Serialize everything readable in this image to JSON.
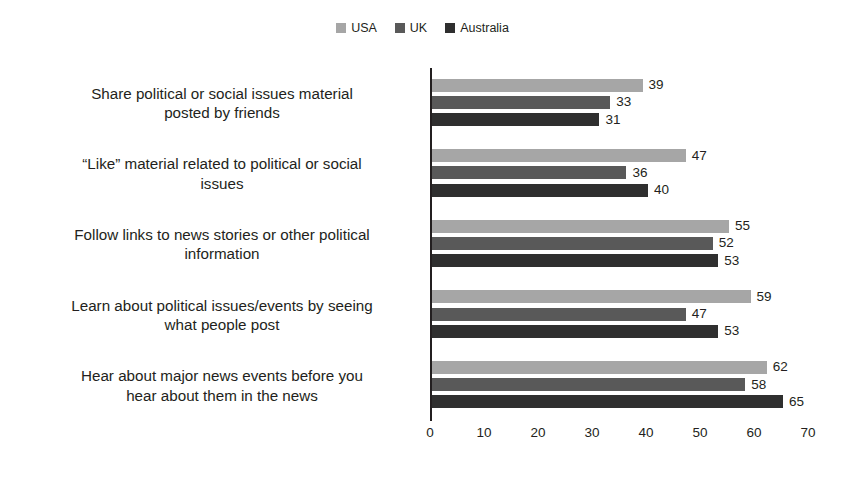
{
  "chart_data": {
    "type": "bar",
    "orientation": "horizontal",
    "title": "",
    "subtitle": "",
    "xlabel": "",
    "ylabel": "",
    "xlim": [
      0,
      70
    ],
    "xticks": [
      0,
      10,
      20,
      30,
      40,
      50,
      60,
      70
    ],
    "grid": false,
    "legend_position": "top-center",
    "categories": [
      "Share political or social issues material posted by friends",
      "“Like” material related to political or social issues",
      "Follow links to news stories or other political information",
      "Learn about political issues/events by seeing what people post",
      "Hear about major news events before you hear about them in the news"
    ],
    "category_lines": [
      [
        "Share political or social issues material",
        "posted by friends"
      ],
      [
        "“Like” material related to political or social",
        "issues"
      ],
      [
        "Follow links to news stories or other political",
        "information"
      ],
      [
        "Learn about political issues/events by seeing",
        "what people post"
      ],
      [
        "Hear about major news events before you",
        "hear about them in the news"
      ]
    ],
    "series": [
      {
        "name": "USA",
        "color": "#a6a6a6",
        "values": [
          39,
          47,
          55,
          59,
          62
        ]
      },
      {
        "name": "UK",
        "color": "#595959",
        "values": [
          33,
          36,
          52,
          47,
          58
        ]
      },
      {
        "name": "Australia",
        "color": "#2f2f2f",
        "values": [
          31,
          40,
          53,
          53,
          65
        ]
      }
    ]
  },
  "legend": {
    "items": [
      {
        "label": "USA",
        "color": "#a6a6a6"
      },
      {
        "label": "UK",
        "color": "#595959"
      },
      {
        "label": "Australia",
        "color": "#2f2f2f"
      }
    ]
  }
}
